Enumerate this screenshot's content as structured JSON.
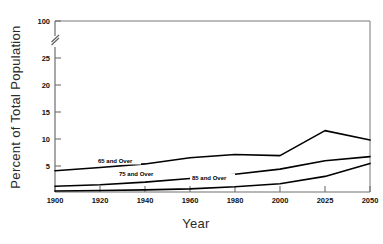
{
  "chart_data": {
    "type": "line",
    "title": "",
    "xlabel": "Year",
    "ylabel": "Percent of Total Population",
    "categories": [
      "1900",
      "1920",
      "1940",
      "1960",
      "1980",
      "2000",
      "2025",
      "2050"
    ],
    "x": [
      1900,
      1920,
      1940,
      1960,
      1980,
      2000,
      2025,
      2050
    ],
    "xtick_labels": [
      "1900",
      "1920",
      "1940",
      "1960",
      "1980",
      "2000",
      "2025",
      "2050"
    ],
    "ytick_labels": [
      "5",
      "10",
      "15",
      "20",
      "25",
      "100"
    ],
    "ytick_values": [
      5,
      10,
      15,
      20,
      25,
      100
    ],
    "ylim": [
      0,
      100
    ],
    "axis_break": {
      "present": true,
      "between": [
        25,
        100
      ],
      "symbol": "double-slash"
    },
    "grid": false,
    "legend": "inline-labels",
    "series": [
      {
        "name": "65 and Over",
        "label": "65 and Over",
        "values": [
          4.1,
          4.7,
          5.4,
          6.6,
          7.2,
          7.0,
          11.8,
          10.0
        ]
      },
      {
        "name": "75 and Over",
        "label": "75 and Over",
        "values": [
          1.1,
          1.4,
          1.9,
          2.6,
          3.4,
          4.4,
          6.0,
          6.8
        ]
      },
      {
        "name": "85 and Over",
        "label": "85 and Over",
        "values": [
          0.2,
          0.3,
          0.4,
          0.6,
          1.0,
          1.6,
          3.0,
          5.5
        ]
      }
    ],
    "annotations": [
      {
        "text": "65 and Over",
        "x": 1920,
        "y": 5.3
      },
      {
        "text": "75 and Over",
        "x": 1930,
        "y": 2.6
      },
      {
        "text": "85 and Over",
        "x": 1972,
        "y": 1.6
      }
    ]
  },
  "axes": {
    "x_title": "Year",
    "y_title": "Percent of Total Population"
  }
}
